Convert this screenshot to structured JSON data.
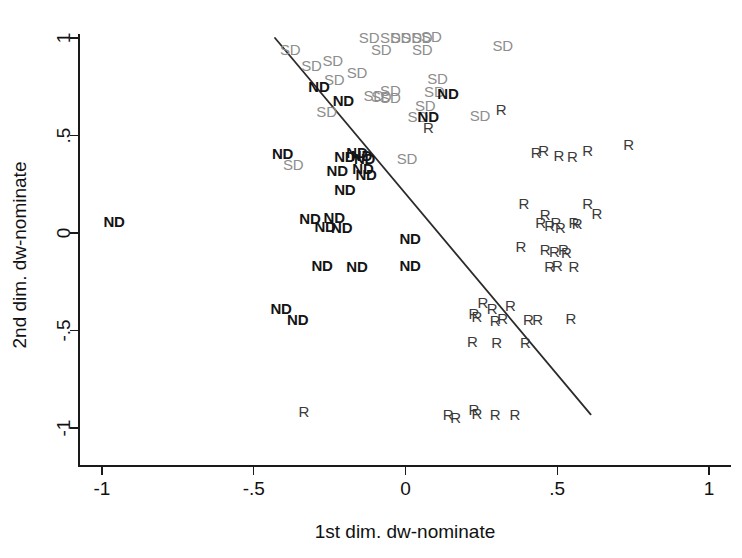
{
  "chart_data": {
    "type": "scatter",
    "title": "",
    "xlabel": "1st dim. dw-nominate",
    "ylabel": "2nd dim. dw-nominate",
    "xlim": [
      -1.12,
      1.12
    ],
    "ylim": [
      -1.12,
      1.12
    ],
    "xticks": [
      -1,
      -0.5,
      0,
      0.5,
      1
    ],
    "xticklabels": [
      "-1",
      "-.5",
      "0",
      ".5",
      "1"
    ],
    "yticks": [
      -1,
      -0.5,
      0,
      0.5,
      1
    ],
    "yticklabels": [
      "-1",
      "-.5",
      "0",
      ".5",
      "1"
    ],
    "grid": false,
    "legend": "none",
    "marker_style": "text-labels",
    "annotations": [
      {
        "name": "separating-line",
        "type": "line",
        "x0": -0.43,
        "y0": 1.0,
        "x1": 0.61,
        "y1": -0.93,
        "color": "#2b2b2b"
      }
    ],
    "groups": [
      {
        "key": "ND",
        "label": "ND",
        "color": "#141414",
        "weight": "bold"
      },
      {
        "key": "R",
        "label": "R",
        "color": "#3a3a3a",
        "weight": "normal"
      },
      {
        "key": "SD",
        "label": "SD",
        "color": "#8d8d8d",
        "weight": "normal"
      }
    ],
    "points": [
      {
        "label": "SD",
        "x": -0.38,
        "y": 0.945
      },
      {
        "label": "SD",
        "x": -0.24,
        "y": 0.885
      },
      {
        "label": "SD",
        "x": -0.12,
        "y": 1.005
      },
      {
        "label": "SD",
        "x": -0.05,
        "y": 1.005
      },
      {
        "label": "SD",
        "x": -0.015,
        "y": 1.005
      },
      {
        "label": "SD",
        "x": 0.02,
        "y": 1.005
      },
      {
        "label": "SD",
        "x": 0.055,
        "y": 1.005
      },
      {
        "label": "SD",
        "x": 0.085,
        "y": 1.01
      },
      {
        "label": "SD",
        "x": -0.08,
        "y": 0.945
      },
      {
        "label": "SD",
        "x": 0.055,
        "y": 0.945
      },
      {
        "label": "SD",
        "x": 0.32,
        "y": 0.965
      },
      {
        "label": "SD",
        "x": -0.31,
        "y": 0.86
      },
      {
        "label": "SD",
        "x": -0.16,
        "y": 0.825
      },
      {
        "label": "SD",
        "x": -0.235,
        "y": 0.79
      },
      {
        "label": "SD",
        "x": 0.105,
        "y": 0.795
      },
      {
        "label": "ND",
        "x": -0.285,
        "y": 0.755
      },
      {
        "label": "SD",
        "x": -0.05,
        "y": 0.735
      },
      {
        "label": "SD",
        "x": 0.095,
        "y": 0.73
      },
      {
        "label": "ND",
        "x": 0.14,
        "y": 0.72
      },
      {
        "label": "SD",
        "x": -0.105,
        "y": 0.71
      },
      {
        "label": "SD",
        "x": -0.08,
        "y": 0.705
      },
      {
        "label": "SD",
        "x": -0.05,
        "y": 0.7
      },
      {
        "label": "ND",
        "x": -0.205,
        "y": 0.68
      },
      {
        "label": "SD",
        "x": 0.065,
        "y": 0.655
      },
      {
        "label": "SD",
        "x": -0.26,
        "y": 0.625
      },
      {
        "label": "SD",
        "x": 0.04,
        "y": 0.6
      },
      {
        "label": "ND",
        "x": 0.075,
        "y": 0.6
      },
      {
        "label": "SD",
        "x": 0.245,
        "y": 0.605
      },
      {
        "label": "R",
        "x": 0.315,
        "y": 0.635
      },
      {
        "label": "R",
        "x": 0.075,
        "y": 0.545
      },
      {
        "label": "ND",
        "x": -0.405,
        "y": 0.41
      },
      {
        "label": "SD",
        "x": -0.37,
        "y": 0.355
      },
      {
        "label": "ND",
        "x": -0.2,
        "y": 0.395
      },
      {
        "label": "ND",
        "x": -0.16,
        "y": 0.415
      },
      {
        "label": "ND",
        "x": -0.145,
        "y": 0.4
      },
      {
        "label": "ND",
        "x": -0.135,
        "y": 0.385
      },
      {
        "label": "ND",
        "x": -0.225,
        "y": 0.325
      },
      {
        "label": "ND",
        "x": -0.14,
        "y": 0.335
      },
      {
        "label": "ND",
        "x": -0.13,
        "y": 0.305
      },
      {
        "label": "SD",
        "x": 0.005,
        "y": 0.385
      },
      {
        "label": "ND",
        "x": -0.2,
        "y": 0.225
      },
      {
        "label": "R",
        "x": 0.43,
        "y": 0.415
      },
      {
        "label": "R",
        "x": 0.455,
        "y": 0.425
      },
      {
        "label": "R",
        "x": 0.505,
        "y": 0.4
      },
      {
        "label": "R",
        "x": 0.55,
        "y": 0.395
      },
      {
        "label": "R",
        "x": 0.6,
        "y": 0.425
      },
      {
        "label": "R",
        "x": 0.735,
        "y": 0.455
      },
      {
        "label": "ND",
        "x": -0.315,
        "y": 0.075
      },
      {
        "label": "ND",
        "x": -0.235,
        "y": 0.08
      },
      {
        "label": "ND",
        "x": -0.265,
        "y": 0.035
      },
      {
        "label": "ND",
        "x": -0.21,
        "y": 0.03
      },
      {
        "label": "ND",
        "x": -0.96,
        "y": 0.06
      },
      {
        "label": "ND",
        "x": 0.015,
        "y": -0.025
      },
      {
        "label": "R",
        "x": 0.39,
        "y": 0.155
      },
      {
        "label": "R",
        "x": 0.46,
        "y": 0.095
      },
      {
        "label": "R",
        "x": 0.445,
        "y": 0.055
      },
      {
        "label": "R",
        "x": 0.475,
        "y": 0.04
      },
      {
        "label": "R",
        "x": 0.495,
        "y": 0.055
      },
      {
        "label": "R",
        "x": 0.51,
        "y": 0.03
      },
      {
        "label": "R",
        "x": 0.555,
        "y": 0.055
      },
      {
        "label": "R",
        "x": 0.565,
        "y": 0.05
      },
      {
        "label": "R",
        "x": 0.63,
        "y": 0.105
      },
      {
        "label": "R",
        "x": 0.6,
        "y": 0.155
      },
      {
        "label": "ND",
        "x": -0.275,
        "y": -0.165
      },
      {
        "label": "ND",
        "x": -0.16,
        "y": -0.17
      },
      {
        "label": "ND",
        "x": 0.015,
        "y": -0.165
      },
      {
        "label": "R",
        "x": 0.38,
        "y": -0.065
      },
      {
        "label": "R",
        "x": 0.46,
        "y": -0.08
      },
      {
        "label": "R",
        "x": 0.49,
        "y": -0.09
      },
      {
        "label": "R",
        "x": 0.53,
        "y": -0.095
      },
      {
        "label": "R",
        "x": 0.52,
        "y": -0.08
      },
      {
        "label": "R",
        "x": 0.555,
        "y": -0.17
      },
      {
        "label": "R",
        "x": 0.475,
        "y": -0.17
      },
      {
        "label": "R",
        "x": 0.5,
        "y": -0.165
      },
      {
        "label": "ND",
        "x": -0.41,
        "y": -0.385
      },
      {
        "label": "ND",
        "x": -0.355,
        "y": -0.44
      },
      {
        "label": "R",
        "x": 0.255,
        "y": -0.355
      },
      {
        "label": "R",
        "x": 0.285,
        "y": -0.385
      },
      {
        "label": "R",
        "x": 0.225,
        "y": -0.41
      },
      {
        "label": "R",
        "x": 0.235,
        "y": -0.425
      },
      {
        "label": "R",
        "x": 0.345,
        "y": -0.37
      },
      {
        "label": "R",
        "x": 0.295,
        "y": -0.445
      },
      {
        "label": "R",
        "x": 0.32,
        "y": -0.435
      },
      {
        "label": "R",
        "x": 0.405,
        "y": -0.44
      },
      {
        "label": "R",
        "x": 0.435,
        "y": -0.44
      },
      {
        "label": "R",
        "x": 0.545,
        "y": -0.435
      },
      {
        "label": "R",
        "x": 0.22,
        "y": -0.555
      },
      {
        "label": "R",
        "x": 0.3,
        "y": -0.56
      },
      {
        "label": "R",
        "x": 0.395,
        "y": -0.56
      },
      {
        "label": "R",
        "x": -0.335,
        "y": -0.915
      },
      {
        "label": "R",
        "x": 0.14,
        "y": -0.93
      },
      {
        "label": "R",
        "x": 0.165,
        "y": -0.945
      },
      {
        "label": "R",
        "x": 0.225,
        "y": -0.9
      },
      {
        "label": "R",
        "x": 0.235,
        "y": -0.925
      },
      {
        "label": "R",
        "x": 0.295,
        "y": -0.93
      },
      {
        "label": "R",
        "x": 0.36,
        "y": -0.93
      }
    ]
  },
  "axes": {
    "x_title": "1st dim. dw-nominate",
    "y_title": "2nd dim. dw-nominate"
  }
}
